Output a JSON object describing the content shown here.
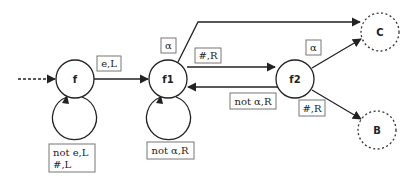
{
  "diagram": {
    "type": "state-machine",
    "states": {
      "f": "f",
      "f1": "f1",
      "f2": "f2",
      "C": "C",
      "B": "B"
    },
    "transitions": {
      "f_to_f1": "e,L",
      "f_self": [
        "not e,L",
        "#,L"
      ],
      "f1_self": "not α,R",
      "f1_to_C": "α",
      "f1_to_f2": "#,R",
      "f2_to_f1": "not α,R",
      "f2_to_C": "α",
      "f2_to_B": "#,R"
    }
  }
}
